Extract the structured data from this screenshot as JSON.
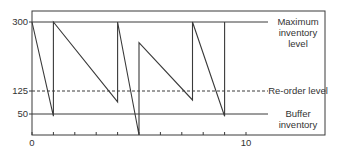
{
  "chart_data": {
    "type": "line",
    "title": "",
    "xlabel": "",
    "ylabel": "",
    "xlim": [
      0,
      13.7
    ],
    "ylim": [
      0,
      330
    ],
    "grid": false,
    "x_ticks": [
      0,
      1,
      2,
      3,
      4,
      5,
      6,
      7,
      8,
      9,
      10
    ],
    "x_tick_labels": [
      "0",
      "10"
    ],
    "y_tick_labels": [
      "300",
      "125",
      "50"
    ],
    "series": [
      {
        "name": "Inventory level",
        "x": [
          0,
          1,
          1,
          4,
          4,
          5,
          5,
          7.5,
          7.5,
          9,
          9
        ],
        "y": [
          300,
          50,
          300,
          88,
          300,
          0,
          245,
          93,
          300,
          50,
          300
        ]
      }
    ],
    "reference_lines": [
      {
        "name": "Maximum inventory level",
        "y": 300,
        "style": "solid"
      },
      {
        "name": "Re-order level",
        "y": 125,
        "style": "dashed"
      },
      {
        "name": "Buffer inventory",
        "y": 50,
        "style": "solid"
      }
    ],
    "annotations": {
      "max_label_1": "Maximum",
      "max_label_2": "inventory",
      "max_label_3": "level",
      "reorder_label": "Re-order level",
      "buffer_label_1": "Buffer",
      "buffer_label_2": "inventory"
    },
    "colors": {
      "line": "#3a3a3a",
      "frame": "#3a3a3a"
    }
  }
}
